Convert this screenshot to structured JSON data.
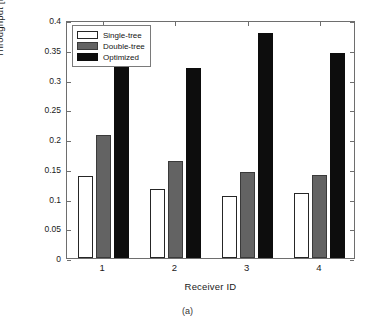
{
  "caption": "(a)",
  "chart_data": {
    "type": "bar",
    "title": "",
    "xlabel": "Receiver ID",
    "ylabel": "Throughput [Mbps]",
    "categories": [
      "1",
      "2",
      "3",
      "4"
    ],
    "series": [
      {
        "name": "Single-tree",
        "color": "#ffffff",
        "values": [
          0.138,
          0.116,
          0.105,
          0.109
        ]
      },
      {
        "name": "Double-tree",
        "color": "#636363",
        "values": [
          0.207,
          0.163,
          0.145,
          0.14
        ]
      },
      {
        "name": "Optimized",
        "color": "#0d0d0d",
        "values": [
          0.328,
          0.319,
          0.378,
          0.345
        ]
      }
    ],
    "ylim": [
      0,
      0.4
    ],
    "yticks": [
      "0",
      "0.05",
      "0.1",
      "0.15",
      "0.2",
      "0.25",
      "0.3",
      "0.35",
      "0.4"
    ],
    "ytick_values": [
      0,
      0.05,
      0.1,
      0.15,
      0.2,
      0.25,
      0.3,
      0.35,
      0.4
    ],
    "xticks": [
      "1",
      "2",
      "3",
      "4"
    ],
    "grid": false,
    "legend_position": "top-left",
    "legend_entries": [
      "Single-tree",
      "Double-tree",
      "Optimized"
    ]
  }
}
